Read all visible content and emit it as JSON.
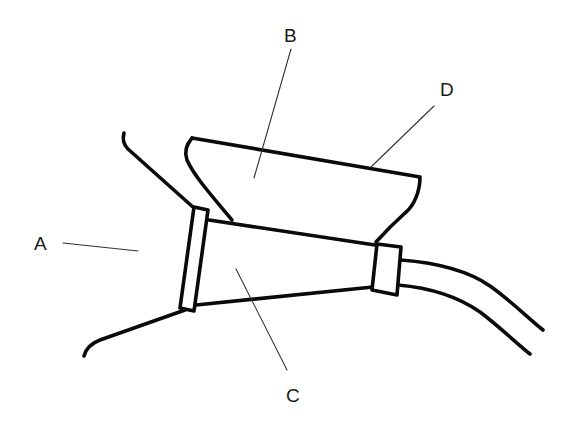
{
  "diagram": {
    "type": "labeled technical line drawing",
    "background": "#ffffff",
    "stroke_color": "#0a0a0a",
    "labels": [
      {
        "id": "A",
        "text": "A",
        "x": 36,
        "y": 248
      },
      {
        "id": "B",
        "text": "B",
        "x": 285,
        "y": 45
      },
      {
        "id": "C",
        "text": "C",
        "x": 287,
        "y": 402
      },
      {
        "id": "D",
        "text": "D",
        "x": 440,
        "y": 97
      }
    ],
    "parts": [
      {
        "id": "A",
        "description": "outer wall / hull opening (left curved lines)"
      },
      {
        "id": "B",
        "description": "upper hopper / tray body"
      },
      {
        "id": "C",
        "description": "tapered conical tube between two collars"
      },
      {
        "id": "D",
        "description": "top edge / rim of tray"
      }
    ]
  }
}
